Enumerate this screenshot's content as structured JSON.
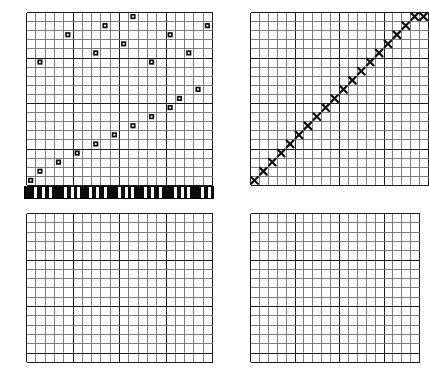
{
  "figure": {
    "background_color": "#ffffff",
    "grid_minor_color": "#6e6e6e",
    "grid_major_color": "#1a1a1a",
    "marker_color": "#111111",
    "panel_count": 4
  },
  "panels": [
    {
      "name": "top-left-grid",
      "x": 26,
      "y": 12,
      "cols": 20,
      "rows": 19,
      "cell_w": 9.3,
      "cell_h": 9.1,
      "major_every": 5,
      "marker_type": "square-dot",
      "markers": [
        {
          "col": 11,
          "row": 0
        },
        {
          "col": 8,
          "row": 1
        },
        {
          "col": 19,
          "row": 1
        },
        {
          "col": 4,
          "row": 2
        },
        {
          "col": 15,
          "row": 2
        },
        {
          "col": 10,
          "row": 3
        },
        {
          "col": 7,
          "row": 4
        },
        {
          "col": 17,
          "row": 4
        },
        {
          "col": 1,
          "row": 5
        },
        {
          "col": 13,
          "row": 5
        },
        {
          "col": 20,
          "row": 7
        },
        {
          "col": 18,
          "row": 8
        },
        {
          "col": 16,
          "row": 9
        },
        {
          "col": 15,
          "row": 10
        },
        {
          "col": 13,
          "row": 11
        },
        {
          "col": 11,
          "row": 12
        },
        {
          "col": 9,
          "row": 13
        },
        {
          "col": 7,
          "row": 14
        },
        {
          "col": 5,
          "row": 15
        },
        {
          "col": 3,
          "row": 16
        },
        {
          "col": 1,
          "row": 17
        },
        {
          "col": 0,
          "row": 18
        }
      ]
    },
    {
      "name": "top-right-grid",
      "x": 250,
      "y": 12,
      "cols": 20,
      "rows": 19,
      "cell_w": 8.9,
      "cell_h": 9.1,
      "major_every": 5,
      "marker_type": "x-cross",
      "markers": [
        {
          "col": 0,
          "row": 18
        },
        {
          "col": 1,
          "row": 17
        },
        {
          "col": 2,
          "row": 16
        },
        {
          "col": 3,
          "row": 15
        },
        {
          "col": 4,
          "row": 14
        },
        {
          "col": 5,
          "row": 13
        },
        {
          "col": 6,
          "row": 12
        },
        {
          "col": 7,
          "row": 11
        },
        {
          "col": 8,
          "row": 10
        },
        {
          "col": 9,
          "row": 9
        },
        {
          "col": 10,
          "row": 8
        },
        {
          "col": 11,
          "row": 7
        },
        {
          "col": 12,
          "row": 6
        },
        {
          "col": 13,
          "row": 5
        },
        {
          "col": 14,
          "row": 4
        },
        {
          "col": 15,
          "row": 3
        },
        {
          "col": 16,
          "row": 2
        },
        {
          "col": 17,
          "row": 1
        },
        {
          "col": 18,
          "row": 0
        },
        {
          "col": 19,
          "row": 0
        }
      ]
    },
    {
      "name": "bottom-left-grid",
      "x": 26,
      "y": 213,
      "cols": 20,
      "rows": 16,
      "cell_w": 9.3,
      "cell_h": 9.3,
      "major_every": 5,
      "marker_type": "none",
      "markers": []
    },
    {
      "name": "bottom-right-grid",
      "x": 250,
      "y": 213,
      "cols": 19,
      "rows": 16,
      "cell_w": 8.9,
      "cell_h": 9.3,
      "major_every": 5,
      "marker_type": "none",
      "markers": []
    }
  ],
  "barcode_strip": {
    "name": "barcode-strip",
    "x": 24,
    "y": 186,
    "width": 190,
    "height": 13,
    "bar_color": "#0b0b0b",
    "background_color": "#ffffff",
    "bars": [
      {
        "start": 0,
        "width": 9
      },
      {
        "start": 12,
        "width": 5
      },
      {
        "start": 20,
        "width": 4
      },
      {
        "start": 27,
        "width": 12
      },
      {
        "start": 42,
        "width": 4
      },
      {
        "start": 49,
        "width": 3
      },
      {
        "start": 55,
        "width": 9
      },
      {
        "start": 67,
        "width": 4
      },
      {
        "start": 74,
        "width": 5
      },
      {
        "start": 82,
        "width": 11
      },
      {
        "start": 96,
        "width": 4
      },
      {
        "start": 103,
        "width": 3
      },
      {
        "start": 109,
        "width": 10
      },
      {
        "start": 122,
        "width": 4
      },
      {
        "start": 129,
        "width": 5
      },
      {
        "start": 137,
        "width": 12
      },
      {
        "start": 152,
        "width": 4
      },
      {
        "start": 159,
        "width": 3
      },
      {
        "start": 165,
        "width": 11
      },
      {
        "start": 179,
        "width": 4
      },
      {
        "start": 186,
        "width": 4
      }
    ]
  }
}
